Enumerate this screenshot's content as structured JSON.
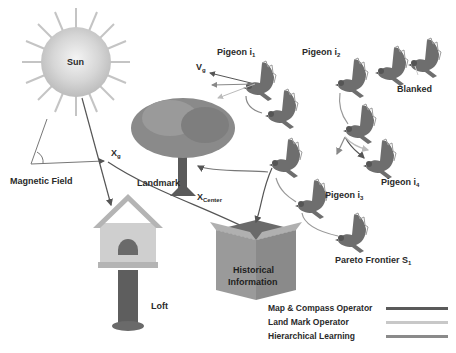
{
  "diagram": {
    "labels": {
      "sun": "Sun",
      "magnetic_field": "Magnetic Field",
      "landmark": "Landmark",
      "x_g": "X",
      "x_g_sub": "g",
      "x_center": "X",
      "x_center_sub": "Center",
      "v_g": "V",
      "v_g_sub": "g",
      "loft": "Loft",
      "historical_1": "Historical",
      "historical_2": "Information",
      "blanked": "Blanked",
      "pigeon_1": "Pigeon i",
      "pigeon_1_sub": "1",
      "pigeon_2": "Pigeon i",
      "pigeon_2_sub": "2",
      "pigeon_3": "Pigeon i",
      "pigeon_3_sub": "3",
      "pigeon_4": "Pigeon i",
      "pigeon_4_sub": "4",
      "pareto": "Pareto Frontier S",
      "pareto_sub": "1"
    },
    "legend": [
      {
        "label": "Map & Compass Operator",
        "color": "#5a5a5a"
      },
      {
        "label": "Land Mark Operator",
        "color": "#c8c8c8"
      },
      {
        "label": "Hierarchical Learning",
        "color": "#8a8a8a"
      }
    ]
  }
}
